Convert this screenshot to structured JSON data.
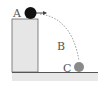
{
  "labels": {
    "a": "A",
    "b": "B",
    "c": "C"
  },
  "colors": {
    "ball_a": "#111111",
    "ball_c": "#8a8a8a",
    "block": "#e4e4e4",
    "ground": "#e6e6e6",
    "line": "#555555"
  }
}
